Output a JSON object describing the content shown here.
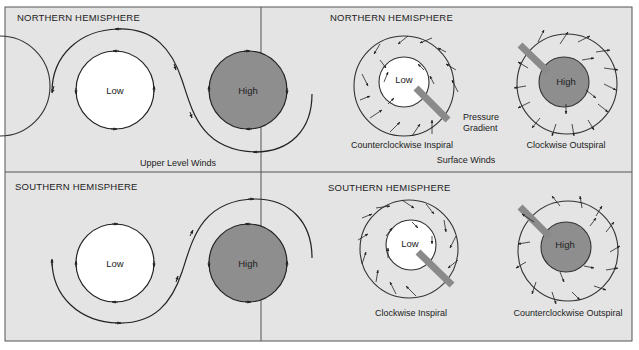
{
  "figure": {
    "background": "#e4e4e4",
    "border_color": "#555555",
    "low_fill": "#ffffff",
    "high_fill": "#8e8e8e",
    "gradient_arrow_color": "#8a8a8a",
    "line_color": "#222222"
  },
  "panels": {
    "nw": {
      "title": "NORTHERN HEMISPHERE",
      "low_label": "Low",
      "high_label": "High",
      "caption": "Upper Level Winds"
    },
    "ne": {
      "title": "NORTHERN HEMISPHERE",
      "low_label": "Low",
      "high_label": "High",
      "low_caption": "Counterclockwise Inspiral",
      "high_caption": "Clockwise Outspiral",
      "gradient_label_1": "Pressure",
      "gradient_label_2": "Gradient",
      "caption": "Surface Winds"
    },
    "sw": {
      "title": "SOUTHERN HEMISPHERE",
      "low_label": "Low",
      "high_label": "High"
    },
    "se": {
      "title": "SOUTHERN HEMISPHERE",
      "low_label": "Low",
      "high_label": "High",
      "low_caption": "Clockwise Inspiral",
      "high_caption": "Counterclockwise Outspiral"
    }
  }
}
